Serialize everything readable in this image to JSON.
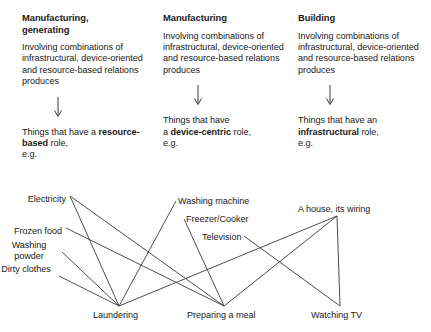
{
  "columns": [
    {
      "title": "Manufacturing,\ngenerating",
      "body": "Involving combinations of infrastructural, device-oriented and resource-based relations produces",
      "foot_prefix": "Things that have a",
      "foot_bold": "resource-based",
      "foot_suffix": " role,",
      "foot_eg": "e.g."
    },
    {
      "title": "Manufacturing",
      "body": "Involving combinations of infrastructural, device-oriented and resource-based relations produces",
      "foot_prefix": "Things that have",
      "foot_bold": "device-centric",
      "foot_suffix": " role,",
      "foot_eg": "e.g.",
      "foot_lead": "a "
    },
    {
      "title": "Building",
      "body": "Involving combinations of infrastructural, device-oriented and resource-based relations produces",
      "foot_prefix": "Things that have an",
      "foot_bold": "infrastructural",
      "foot_suffix": " role,",
      "foot_eg": "e.g."
    }
  ],
  "network": {
    "nodes": [
      {
        "id": "electricity",
        "label": "Electricity",
        "x": 66,
        "y": 18,
        "anchor_x": 70,
        "anchor_y": 20,
        "align": "right",
        "multiline": false
      },
      {
        "id": "frozen-food",
        "label": "Frozen food",
        "x": 62,
        "y": 50,
        "anchor_x": 66,
        "anchor_y": 52,
        "align": "right",
        "multiline": false
      },
      {
        "id": "washing-powder",
        "label": "Washing powder",
        "x": 58,
        "y": 64,
        "anchor_x": 62,
        "anchor_y": 76,
        "align": "right",
        "multiline": true
      },
      {
        "id": "dirty-clothes",
        "label": "Dirty clothes",
        "x": 55,
        "y": 88,
        "anchor_x": 59,
        "anchor_y": 100,
        "align": "right",
        "multiline": true
      },
      {
        "id": "washing-machine",
        "label": "Washing machine",
        "x": 178,
        "y": 20,
        "anchor_x": 176,
        "anchor_y": 25,
        "align": "left",
        "multiline": false
      },
      {
        "id": "freezer-cooker",
        "label": "Freezer/Cooker",
        "x": 186,
        "y": 38,
        "anchor_x": 184,
        "anchor_y": 43,
        "align": "left",
        "multiline": false
      },
      {
        "id": "television",
        "label": "Television",
        "x": 202,
        "y": 56,
        "anchor_x": 244,
        "anchor_y": 60,
        "align": "left",
        "multiline": false
      },
      {
        "id": "house-wiring",
        "label": "A house, its wiring",
        "x": 298,
        "y": 28,
        "anchor_x": 337,
        "anchor_y": 40,
        "align": "left",
        "multiline": false
      },
      {
        "id": "laundering",
        "label": "Laundering",
        "x": 93,
        "y": 134,
        "anchor_x": 119,
        "anchor_y": 130,
        "align": "left",
        "multiline": false
      },
      {
        "id": "preparing-meal",
        "label": "Preparing a meal",
        "x": 187,
        "y": 134,
        "anchor_x": 224,
        "anchor_y": 130,
        "align": "left",
        "multiline": false
      },
      {
        "id": "watching-tv",
        "label": "Watching TV",
        "x": 311,
        "y": 134,
        "anchor_x": 340,
        "anchor_y": 130,
        "align": "left",
        "multiline": false
      }
    ],
    "edges": [
      {
        "from": "electricity",
        "to": "laundering"
      },
      {
        "from": "electricity",
        "to": "preparing-meal"
      },
      {
        "from": "frozen-food",
        "to": "preparing-meal"
      },
      {
        "from": "washing-powder",
        "to": "laundering"
      },
      {
        "from": "dirty-clothes",
        "to": "laundering"
      },
      {
        "from": "washing-machine",
        "to": "laundering"
      },
      {
        "from": "freezer-cooker",
        "to": "preparing-meal"
      },
      {
        "from": "television",
        "to": "watching-tv"
      },
      {
        "from": "house-wiring",
        "to": "laundering"
      },
      {
        "from": "house-wiring",
        "to": "preparing-meal"
      },
      {
        "from": "house-wiring",
        "to": "watching-tv"
      }
    ],
    "line_color": "#3a3a3a"
  },
  "colors": {
    "text": "#1a1a1a",
    "line": "#3a3a3a",
    "background": "#ffffff"
  }
}
